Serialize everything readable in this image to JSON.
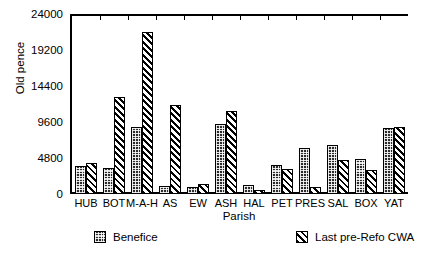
{
  "chart_data": {
    "type": "bar",
    "title": "",
    "subtitle": "",
    "xlabel": "Parish",
    "ylabel": "Old pence",
    "grid": false,
    "legend_position": "bottom",
    "ylim": [
      0,
      24000
    ],
    "ytick_labels": [
      "0",
      "4800",
      "9600",
      "14400",
      "19200",
      "24000"
    ],
    "ytick_values": [
      0,
      4800,
      9600,
      14400,
      19200,
      24000
    ],
    "categories": [
      "HUB",
      "BOT",
      "M-A-H",
      "AS",
      "EW",
      "ASH",
      "HAL",
      "PET",
      "PRES",
      "SAL",
      "BOX",
      "YAT"
    ],
    "series": [
      {
        "name": "Benefice",
        "pattern": "checker-stipple",
        "values": [
          3700,
          3500,
          8900,
          1100,
          900,
          9400,
          1200,
          3900,
          6100,
          6500,
          4700,
          8800
        ]
      },
      {
        "name": "Last pre-Refo CWA",
        "pattern": "diagonal-hatch",
        "values": [
          4100,
          13000,
          21600,
          11900,
          1400,
          11100,
          600,
          3400,
          900,
          4500,
          3200,
          8900
        ]
      }
    ]
  },
  "axis": {
    "y_title": "Old pence",
    "x_title": "Parish"
  },
  "legend": {
    "items": [
      {
        "label": "Benefice"
      },
      {
        "label": "Last pre-Refo CWA"
      }
    ]
  },
  "colors": {
    "ink": "#000000",
    "background": "#ffffff",
    "series_0_fill": "#2b2b2b",
    "series_1_fill": "#ffffff"
  }
}
